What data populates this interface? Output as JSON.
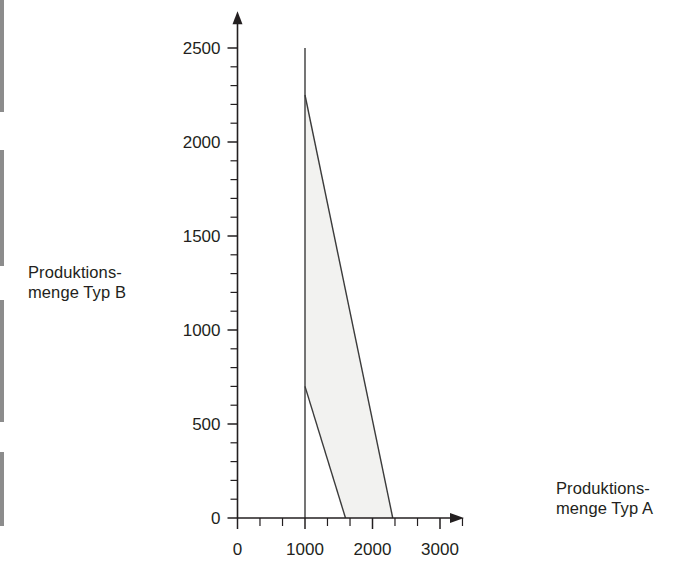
{
  "figure": {
    "y_axis_label": "Produktions-\nmenge Typ B",
    "x_axis_label": "Produktions-\nmenge Typ A"
  },
  "chart_data": {
    "type": "area",
    "title": "",
    "xlabel": "Produktions-menge Typ A",
    "ylabel": "Produktions-menge Typ B",
    "xlim": [
      0,
      3400
    ],
    "ylim": [
      0,
      2600
    ],
    "grid": false,
    "legend": "none",
    "x_ticks_major": [
      0,
      1000,
      2000,
      3000
    ],
    "x_tick_labels": [
      "0",
      "1000",
      "2000",
      "3000"
    ],
    "x_ticks_minor": [
      333,
      667,
      1333,
      1667,
      2333,
      2667,
      3333
    ],
    "y_ticks_major": [
      0,
      500,
      1000,
      1500,
      2000,
      2500
    ],
    "y_tick_labels": [
      "0",
      "500",
      "1000",
      "1500",
      "2000",
      "2500"
    ],
    "y_ticks_minor": [
      100,
      200,
      300,
      400,
      600,
      700,
      800,
      900,
      1100,
      1200,
      1300,
      1400,
      1600,
      1700,
      1800,
      1900,
      2100,
      2200,
      2300,
      2400
    ],
    "series": [
      {
        "name": "Nebenbedingung senkrecht (Typ A = 1000)",
        "type": "line",
        "points": [
          [
            1000,
            0
          ],
          [
            1000,
            2500
          ]
        ]
      },
      {
        "name": "Nebenbedingung obere Gerade",
        "type": "line",
        "points": [
          [
            1000,
            2250
          ],
          [
            2300,
            0
          ]
        ]
      },
      {
        "name": "Nebenbedingung untere Gerade",
        "type": "line",
        "points": [
          [
            1000,
            700
          ],
          [
            1600,
            0
          ]
        ]
      }
    ],
    "shaded_region": {
      "name": "Zulaessiger Bereich",
      "fill_color": "#f2f2f0",
      "vertices": [
        [
          1000,
          2250
        ],
        [
          2300,
          0
        ],
        [
          1600,
          0
        ],
        [
          1000,
          700
        ]
      ]
    },
    "annotations": []
  }
}
